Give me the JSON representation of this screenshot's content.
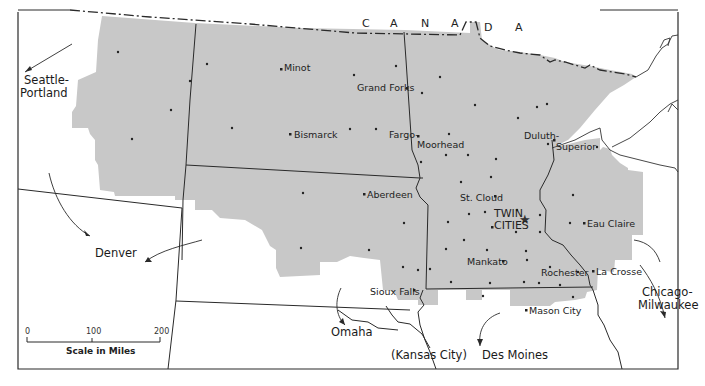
{
  "map": {
    "country_letters": [
      "C",
      "A",
      "N",
      "A",
      "D",
      "A"
    ],
    "country_name": "CANADA",
    "colors": {
      "region_fill": "#c8c8c8",
      "lines": "#2a2a2a",
      "background": "#ffffff"
    },
    "cities": [
      {
        "name": "Minot",
        "marker": "dot"
      },
      {
        "name": "Grand Forks",
        "marker": "dot"
      },
      {
        "name": "Bismarck",
        "marker": "dot"
      },
      {
        "name": "Fargo-",
        "marker": "dot"
      },
      {
        "name": "Moorhead",
        "marker": "none"
      },
      {
        "name": "Duluth-",
        "marker": "dot"
      },
      {
        "name": "Superior",
        "marker": "none"
      },
      {
        "name": "Aberdeen",
        "marker": "dot"
      },
      {
        "name": "St. Cloud",
        "marker": "dot"
      },
      {
        "name": "TWIN",
        "marker": "star"
      },
      {
        "name": "CITIES",
        "marker": "none"
      },
      {
        "name": "Eau Claire",
        "marker": "dot"
      },
      {
        "name": "Mankato",
        "marker": "dot"
      },
      {
        "name": "Rochester",
        "marker": "dot"
      },
      {
        "name": "La Crosse",
        "marker": "dot"
      },
      {
        "name": "Sioux Falls",
        "marker": "dot"
      },
      {
        "name": "Mason City",
        "marker": "dot"
      }
    ],
    "external_destinations": [
      {
        "name": "Seattle-",
        "line2": "Portland"
      },
      {
        "name": "Denver"
      },
      {
        "name": "Omaha"
      },
      {
        "name": "(Kansas City)"
      },
      {
        "name": "Des Moines"
      },
      {
        "name": "Chicago-",
        "line2": "Milwaukee"
      }
    ],
    "scale": {
      "ticks": [
        "0",
        "100",
        "200"
      ],
      "title": "Scale in Miles"
    }
  }
}
